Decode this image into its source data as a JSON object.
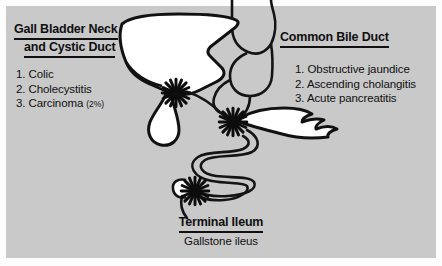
{
  "panel": {
    "background_color": "#c9c9c9",
    "page_background_color": "#fdfdfd",
    "ink_color": "#101010"
  },
  "left_block": {
    "heading_line1": "Gall Bladder Neck",
    "heading_line2": "and Cystic Duct",
    "items": [
      {
        "number": "1.",
        "text": "Colic",
        "note": ""
      },
      {
        "number": "2.",
        "text": "Cholecystitis",
        "note": ""
      },
      {
        "number": "3.",
        "text": "Carcinoma",
        "note": "(2%)"
      }
    ]
  },
  "right_block": {
    "heading": "Common Bile Duct",
    "items": [
      {
        "number": "1.",
        "text": "Obstructive jaundice"
      },
      {
        "number": "2.",
        "text": "Ascending cholangitis"
      },
      {
        "number": "3.",
        "text": "Acute pancreatitis"
      }
    ]
  },
  "bottom_block": {
    "heading": "Terminal Ileum",
    "subtitle": "Gallstone ileus"
  },
  "illustration": {
    "organs": [
      "liver",
      "gallbladder",
      "cystic-duct",
      "common-bile-duct",
      "stomach",
      "duodenum",
      "pancreas",
      "small-bowel",
      "terminal-ileum",
      "cecum"
    ],
    "gallstone_markers": [
      {
        "name": "gallstone-cystic-duct",
        "x": 176,
        "y": 93
      },
      {
        "name": "gallstone-common-bile-duct",
        "x": 233,
        "y": 122
      },
      {
        "name": "gallstone-terminal-ileum",
        "x": 195,
        "y": 191
      }
    ]
  }
}
